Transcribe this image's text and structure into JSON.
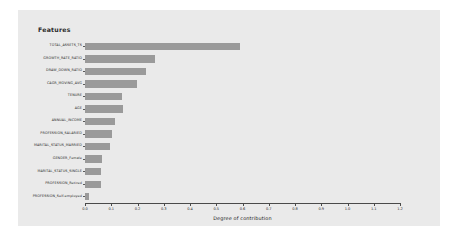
{
  "figure": {
    "legend_title": "Features",
    "panel_color": "#eaeaea",
    "bar_color": "#9a9a9a",
    "axis_color": "#4a4a4a"
  },
  "chart_data": {
    "type": "bar",
    "orientation": "horizontal",
    "title": "",
    "legend_title": "Features",
    "xlabel": "Degree of contribution",
    "ylabel": "",
    "xlim": [
      0.0,
      1.2
    ],
    "grid": false,
    "legend_position": "top-left",
    "xticks": [
      "0.0",
      "0.1",
      "0.2",
      "0.3",
      "0.4",
      "0.5",
      "0.6",
      "0.7",
      "0.8",
      "0.9",
      "1.0",
      "1.1",
      "1.2"
    ],
    "xtick_values": [
      0.0,
      0.1,
      0.2,
      0.3,
      0.4,
      0.5,
      0.6,
      0.7,
      0.8,
      0.9,
      1.0,
      1.1,
      1.2
    ],
    "categories": [
      "TOTAL_ASSETS_TS",
      "GROWTH_RATE_RATIO",
      "DRAW_DOWN_RATIO",
      "CAGR_MOVING_AVG",
      "TENURE",
      "AGE",
      "ANNUAL_INCOME",
      "PROFESSION_SALARIED",
      "MARITAL_STATUS_MARRIED",
      "GENDER_Female",
      "MARITAL_STATUS_SINGLE",
      "PROFESSION_Retired",
      "PROFESSION_Self-employed"
    ],
    "values": [
      0.59,
      0.265,
      0.232,
      0.198,
      0.141,
      0.145,
      0.114,
      0.103,
      0.095,
      0.065,
      0.062,
      0.06,
      0.015
    ]
  }
}
